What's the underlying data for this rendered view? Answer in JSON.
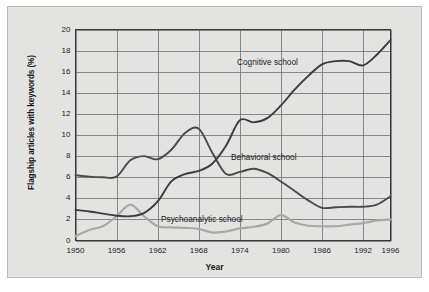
{
  "figure": {
    "background_color": "#e3e3e1",
    "page_color": "#ffffff",
    "border_color": "#b9b9b6"
  },
  "axes": {
    "ylabel": "Flagship articles with keywords (%)",
    "xlabel": "Year",
    "yticks": [
      "0",
      "2",
      "4",
      "6",
      "8",
      "10",
      "12",
      "14",
      "16",
      "18",
      "20"
    ],
    "xticks": [
      "1950",
      "1956",
      "1962",
      "1968",
      "1974",
      "1980",
      "1986",
      "1992",
      "1996"
    ],
    "grid_color": "#6f6f72",
    "axis_color": "#3a3a3d"
  },
  "labels": {
    "cognitive": "Cognitive school",
    "behavioral": "Behavioral school",
    "psychoanalytic": "Psychoanalytic school"
  },
  "chart_data": {
    "type": "line",
    "title": "",
    "xlabel": "Year",
    "ylabel": "Flagship articles with keywords (%)",
    "xlim": [
      1950,
      1996
    ],
    "ylim": [
      0,
      20
    ],
    "ytick_step": 2,
    "xtick_values": [
      1950,
      1956,
      1962,
      1968,
      1974,
      1980,
      1986,
      1992,
      1996
    ],
    "grid": true,
    "legend": "inline-annotations",
    "x": [
      1950,
      1952,
      1954,
      1956,
      1958,
      1960,
      1962,
      1964,
      1966,
      1968,
      1970,
      1972,
      1974,
      1976,
      1978,
      1980,
      1982,
      1984,
      1986,
      1988,
      1990,
      1992,
      1994,
      1996
    ],
    "series": [
      {
        "name": "Cognitive school",
        "color": "#3b3b3e",
        "values": [
          2.9,
          2.75,
          2.55,
          2.35,
          2.3,
          2.6,
          3.7,
          5.6,
          6.3,
          6.6,
          7.3,
          9.0,
          11.4,
          11.2,
          11.6,
          12.8,
          14.3,
          15.6,
          16.7,
          17.0,
          17.0,
          16.6,
          17.6,
          19.0
        ]
      },
      {
        "name": "Behavioral school",
        "color": "#4a4a4d",
        "values": [
          6.2,
          6.05,
          6.0,
          6.05,
          7.6,
          8.0,
          7.7,
          8.6,
          10.2,
          10.6,
          8.3,
          6.3,
          6.5,
          6.8,
          6.4,
          5.6,
          4.7,
          3.8,
          3.1,
          3.15,
          3.2,
          3.2,
          3.4,
          4.2
        ]
      },
      {
        "name": "Psychoanalytic school",
        "color": "#a8a8a6",
        "values": [
          0.4,
          1.0,
          1.35,
          2.3,
          3.4,
          2.3,
          1.35,
          1.25,
          1.2,
          1.1,
          0.75,
          0.85,
          1.15,
          1.3,
          1.6,
          2.4,
          1.7,
          1.4,
          1.35,
          1.35,
          1.5,
          1.65,
          1.9,
          2.0
        ]
      }
    ]
  }
}
